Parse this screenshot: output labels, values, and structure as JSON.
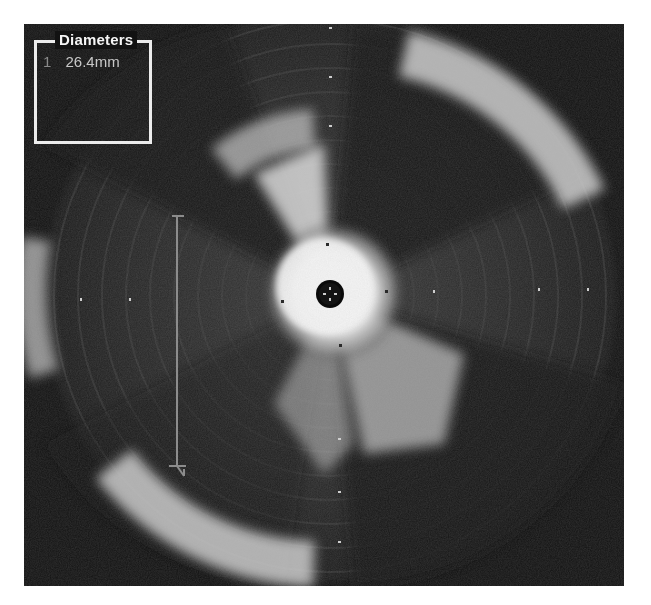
{
  "image": {
    "modality": "Intravascular ultrasound (grayscale)",
    "background_color": "#121212",
    "border_color": "#ffffff"
  },
  "diameters_panel": {
    "title": "Diameters",
    "measurements": [
      {
        "index": "1",
        "value": "26.4mm"
      }
    ]
  },
  "caliper": {
    "label_index": "1",
    "color": "#8c8c8c",
    "x": 153,
    "y_start": 192,
    "y_end": 442
  },
  "catheter": {
    "center_x": 306,
    "center_y": 270,
    "radius": 13
  },
  "scale_markers": {
    "horizontal_x": [
      58,
      106,
      433,
      513,
      563
    ],
    "horizontal_y": 276,
    "vertical_y": [
      4,
      54,
      102,
      150,
      414,
      468,
      518
    ],
    "vertical_x": 316
  }
}
